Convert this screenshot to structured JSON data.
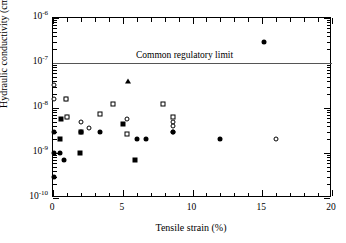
{
  "chart_data": {
    "type": "scatter",
    "title": "",
    "xlabel": "Tensile strain (%)",
    "ylabel": "Hydraulic conductivity (cm/sec)",
    "xlim": [
      0,
      20
    ],
    "ylim": [
      1e-10,
      1e-06
    ],
    "yscale": "log",
    "xticks": [
      0,
      5,
      10,
      15,
      20
    ],
    "xticklabels": [
      "0",
      "5",
      "10",
      "15",
      "20"
    ],
    "yticks": [
      1e-10,
      1e-09,
      1e-08,
      1e-07,
      1e-06
    ],
    "yticklabels": [
      "10-10",
      "10-9",
      "10-8",
      "10-7",
      "10-6"
    ],
    "yticklabels_mantissa": [
      "10",
      "10",
      "10",
      "10",
      "10"
    ],
    "yticklabels_exponent": [
      "-10",
      "-9",
      "-8",
      "-7",
      "-6"
    ],
    "grid": false,
    "legend": null,
    "minor_ticks": true,
    "annotations": [
      {
        "name": "common-regulatory-limit",
        "text": "Common regulatory limit",
        "type": "hline",
        "y": 1e-07,
        "text_x": 9.5,
        "color": "#555555"
      }
    ],
    "series": [
      {
        "name": "open-circle",
        "marker": "open-circle",
        "points": [
          {
            "x": 0.05,
            "y": 3.3e-08
          },
          {
            "x": 0.05,
            "y": 1.6e-08
          },
          {
            "x": 0.9,
            "y": 1.6e-08
          },
          {
            "x": 1.0,
            "y": 6.2e-09
          },
          {
            "x": 2.0,
            "y": 5e-09
          },
          {
            "x": 2.55,
            "y": 3.6e-09
          },
          {
            "x": 5.3,
            "y": 5.6e-09
          },
          {
            "x": 8.6,
            "y": 5e-09
          },
          {
            "x": 8.6,
            "y": 4e-09
          },
          {
            "x": 8.6,
            "y": 2.9e-09
          },
          {
            "x": 16.0,
            "y": 2e-09
          }
        ]
      },
      {
        "name": "open-square",
        "marker": "open-square",
        "points": [
          {
            "x": 0.9,
            "y": 1.6e-08
          },
          {
            "x": 1.0,
            "y": 6.2e-09
          },
          {
            "x": 2.0,
            "y": 3e-09
          },
          {
            "x": 3.4,
            "y": 7.5e-09
          },
          {
            "x": 4.3,
            "y": 1.25e-08
          },
          {
            "x": 5.3,
            "y": 2.6e-09
          },
          {
            "x": 7.9,
            "y": 1.25e-08
          },
          {
            "x": 8.6,
            "y": 6.2e-09
          }
        ]
      },
      {
        "name": "filled-circle",
        "marker": "filled-circle",
        "points": [
          {
            "x": 0.05,
            "y": 3e-09
          },
          {
            "x": 0.05,
            "y": 1e-09
          },
          {
            "x": 0.05,
            "y": 3e-10
          },
          {
            "x": 0.5,
            "y": 1e-09
          },
          {
            "x": 0.8,
            "y": 7e-10
          },
          {
            "x": 2.0,
            "y": 3e-09
          },
          {
            "x": 3.4,
            "y": 3e-09
          },
          {
            "x": 6.0,
            "y": 2e-09
          },
          {
            "x": 6.7,
            "y": 2e-09
          },
          {
            "x": 8.6,
            "y": 3e-09
          },
          {
            "x": 12.0,
            "y": 2e-09
          },
          {
            "x": 15.1,
            "y": 3e-07
          }
        ]
      },
      {
        "name": "filled-square",
        "marker": "filled-square",
        "points": [
          {
            "x": 0.5,
            "y": 2e-09
          },
          {
            "x": 0.55,
            "y": 5.6e-09
          },
          {
            "x": 1.9,
            "y": 1e-09
          },
          {
            "x": 5.0,
            "y": 4.5e-09
          },
          {
            "x": 5.9,
            "y": 7e-10
          }
        ]
      },
      {
        "name": "filled-triangle",
        "marker": "filled-triangle",
        "points": [
          {
            "x": 5.4,
            "y": 4e-08
          }
        ]
      }
    ]
  }
}
